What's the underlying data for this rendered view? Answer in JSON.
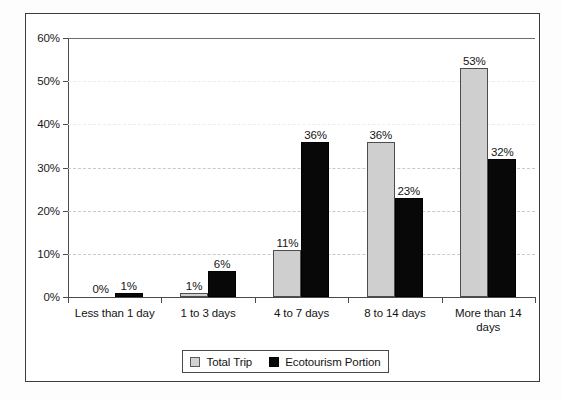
{
  "chart_data": {
    "type": "bar",
    "title": "",
    "xlabel": "",
    "ylabel": "",
    "ylim": [
      0,
      60
    ],
    "ytick_labels": [
      "0%",
      "10%",
      "20%",
      "30%",
      "40%",
      "50%",
      "60%"
    ],
    "ytick_values": [
      0,
      10,
      20,
      30,
      40,
      50,
      60
    ],
    "grid": true,
    "legend_position": "bottom-center",
    "categories": [
      "Less than 1 day",
      "1 to 3 days",
      "4 to 7 days",
      "8 to 14 days",
      "More than 14 days"
    ],
    "category_lines": [
      [
        "Less than 1 day"
      ],
      [
        "1 to 3 days"
      ],
      [
        "4 to 7 days"
      ],
      [
        "8 to 14 days"
      ],
      [
        "More than 14",
        "days"
      ]
    ],
    "series": [
      {
        "name": "Total Trip",
        "color": "#cfcfcf",
        "values": [
          0,
          1,
          11,
          36,
          53
        ],
        "labels": [
          "0%",
          "1%",
          "11%",
          "36%",
          "53%"
        ]
      },
      {
        "name": "Ecotourism Portion",
        "color": "#080808",
        "values": [
          1,
          6,
          36,
          23,
          32
        ],
        "labels": [
          "1%",
          "6%",
          "36%",
          "23%",
          "32%"
        ]
      }
    ]
  },
  "legend": {
    "entries": [
      {
        "label": "Total Trip",
        "swatch": "light-gray-square"
      },
      {
        "label": "Ecotourism Portion",
        "swatch": "black-square"
      }
    ]
  }
}
